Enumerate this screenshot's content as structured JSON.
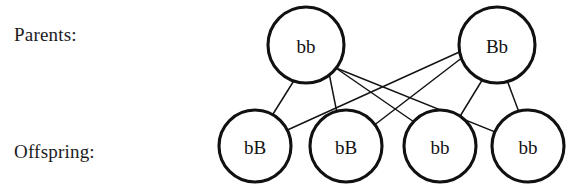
{
  "labels": {
    "parents": "Parents:",
    "offspring": "Offspring:"
  },
  "colors": {
    "background": "#ffffff",
    "stroke": "#111111",
    "text": "#1c1c1c",
    "edge": "#141414"
  },
  "chart_data": {
    "type": "diagram",
    "title": "",
    "diagram_kind": "genetics-cross-pedigree",
    "rows": [
      {
        "name": "parents",
        "label": "Parents:"
      },
      {
        "name": "offspring",
        "label": "Offspring:"
      }
    ],
    "nodes": [
      {
        "id": "p1",
        "row": "parents",
        "genotype": "bb",
        "cx": 306,
        "cy": 45,
        "r": 38
      },
      {
        "id": "p2",
        "row": "parents",
        "genotype": "Bb",
        "cx": 497,
        "cy": 45,
        "r": 38
      },
      {
        "id": "o1",
        "row": "offspring",
        "genotype": "bB",
        "cx": 255,
        "cy": 146,
        "r": 36
      },
      {
        "id": "o2",
        "row": "offspring",
        "genotype": "bB",
        "cx": 346,
        "cy": 146,
        "r": 36
      },
      {
        "id": "o3",
        "row": "offspring",
        "genotype": "bb",
        "cx": 440,
        "cy": 146,
        "r": 36
      },
      {
        "id": "o4",
        "row": "offspring",
        "genotype": "bb",
        "cx": 528,
        "cy": 146,
        "r": 36
      }
    ],
    "edges": [
      {
        "from": "p1",
        "to": "o1",
        "x1": 305,
        "y1": 63,
        "x2": 263,
        "y2": 130
      },
      {
        "from": "p1",
        "to": "o2",
        "x1": 327,
        "y1": 63,
        "x2": 341,
        "y2": 133
      },
      {
        "from": "p1",
        "to": "o3",
        "x1": 330,
        "y1": 64,
        "x2": 430,
        "y2": 133
      },
      {
        "from": "p1",
        "to": "o4",
        "x1": 331,
        "y1": 66,
        "x2": 515,
        "y2": 140
      },
      {
        "from": "p2",
        "to": "o1",
        "x1": 477,
        "y1": 44,
        "x2": 272,
        "y2": 137
      },
      {
        "from": "p2",
        "to": "o2",
        "x1": 476,
        "y1": 47,
        "x2": 364,
        "y2": 133
      },
      {
        "from": "p2",
        "to": "o3",
        "x1": 492,
        "y1": 64,
        "x2": 451,
        "y2": 131
      },
      {
        "from": "p2",
        "to": "o4",
        "x1": 501,
        "y1": 64,
        "x2": 526,
        "y2": 131
      }
    ]
  }
}
